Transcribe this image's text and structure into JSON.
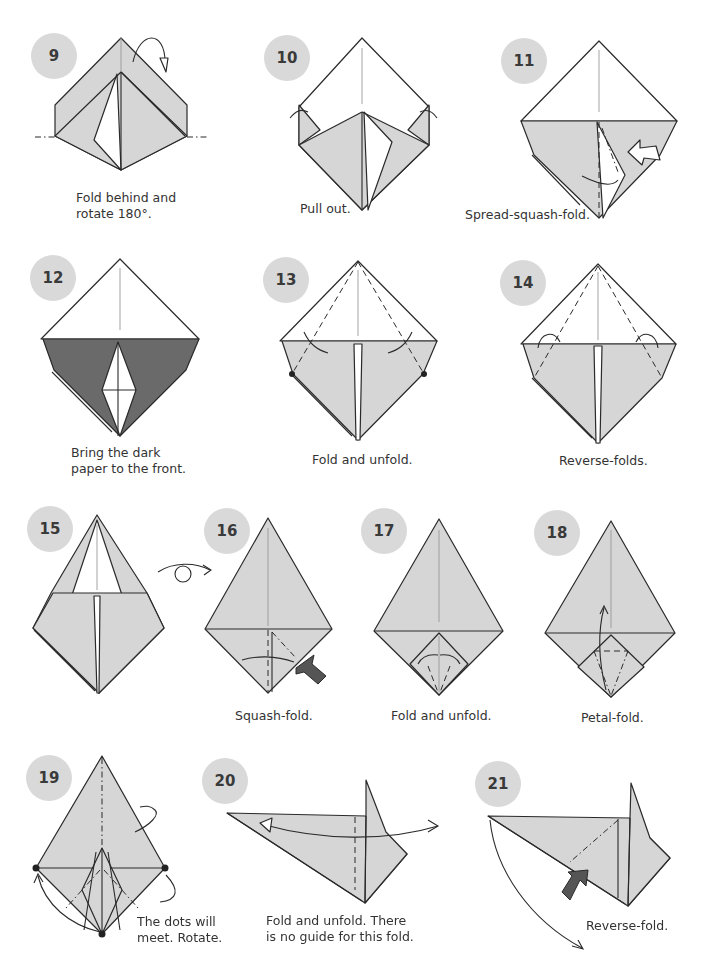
{
  "steps": [
    {
      "number": "9",
      "caption": "Fold behind and\nrotate 180°."
    },
    {
      "number": "10",
      "caption": "Pull out."
    },
    {
      "number": "11",
      "caption": "Spread-squash-fold."
    },
    {
      "number": "12",
      "caption": "Bring the dark\npaper to the front."
    },
    {
      "number": "13",
      "caption": "Fold and unfold."
    },
    {
      "number": "14",
      "caption": "Reverse-folds."
    },
    {
      "number": "15",
      "caption": ""
    },
    {
      "number": "16",
      "caption": "Squash-fold."
    },
    {
      "number": "17",
      "caption": "Fold and unfold."
    },
    {
      "number": "18",
      "caption": "Petal-fold."
    },
    {
      "number": "19",
      "caption": "The dots will\nmeet. Rotate."
    },
    {
      "number": "20",
      "caption": "Fold and unfold. There\nis no guide for this fold."
    },
    {
      "number": "21",
      "caption": "Reverse-fold."
    }
  ],
  "symbols": {
    "turn_over": "turn-over-arrow"
  },
  "colors": {
    "paper": "#d6d6d6",
    "paper_dark": "#6a6a6a",
    "badge": "#d9d9d9",
    "line": "#2a2a2a"
  }
}
